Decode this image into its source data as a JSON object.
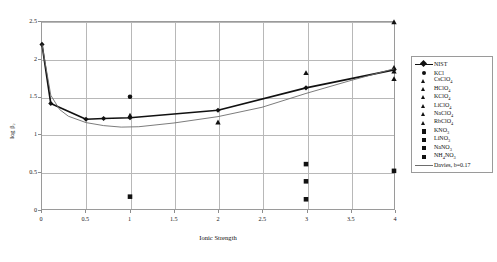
{
  "chart_data": {
    "type": "scatter",
    "title": "",
    "xlabel": "Ionic Strength",
    "ylabel": "log β₂",
    "xlim": [
      0,
      4
    ],
    "ylim": [
      0,
      2.5
    ],
    "xticks": [
      "0",
      "0.5",
      "1",
      "1.5",
      "2",
      "2.5",
      "3",
      "3.5",
      "4"
    ],
    "xtick_values": [
      0,
      0.5,
      1,
      1.5,
      2,
      2.5,
      3,
      3.5,
      4
    ],
    "yticks": [
      "0",
      "0.5",
      "1",
      "1.5",
      "2",
      "2.5"
    ],
    "ytick_values": [
      0,
      0.5,
      1,
      1.5,
      2,
      2.5
    ],
    "grid": true,
    "legend_position": "right",
    "series": [
      {
        "name": "NIST",
        "marker": "line-diamond",
        "color": "#111111",
        "points": [
          {
            "x": 0,
            "y": 2.2
          },
          {
            "x": 0.1,
            "y": 1.41
          },
          {
            "x": 0.5,
            "y": 1.2
          },
          {
            "x": 0.7,
            "y": 1.21
          },
          {
            "x": 1.0,
            "y": 1.22
          },
          {
            "x": 2.0,
            "y": 1.32
          },
          {
            "x": 3.0,
            "y": 1.62
          },
          {
            "x": 4.0,
            "y": 1.86
          }
        ]
      },
      {
        "name": "KCl",
        "marker": "circle",
        "color": "#111111",
        "points": [
          {
            "x": 1.0,
            "y": 1.5
          }
        ]
      },
      {
        "name": "CsClO₄",
        "marker": "triangle",
        "color": "#111111",
        "points": [
          {
            "x": 4.0,
            "y": 2.5
          }
        ]
      },
      {
        "name": "HClO₄",
        "marker": "triangle",
        "color": "#111111",
        "points": [
          {
            "x": 1.0,
            "y": 1.25
          },
          {
            "x": 2.0,
            "y": 1.16
          }
        ]
      },
      {
        "name": "KClO₄",
        "marker": "triangle",
        "color": "#111111",
        "points": [
          {
            "x": 3.0,
            "y": 1.82
          }
        ]
      },
      {
        "name": "LiClO₄",
        "marker": "triangle",
        "color": "#111111",
        "points": [
          {
            "x": 4.0,
            "y": 1.89
          }
        ]
      },
      {
        "name": "NaClO₄",
        "marker": "triangle",
        "color": "#111111",
        "points": [
          {
            "x": 4.0,
            "y": 1.74
          }
        ]
      },
      {
        "name": "RbClO₄",
        "marker": "triangle",
        "color": "#111111",
        "points": [
          {
            "x": 4.0,
            "y": 1.84
          }
        ]
      },
      {
        "name": "KNO₃",
        "marker": "square",
        "color": "#111111",
        "points": [
          {
            "x": 1.0,
            "y": 0.165
          }
        ]
      },
      {
        "name": "LiNO₃",
        "marker": "square",
        "color": "#111111",
        "points": [
          {
            "x": 3.0,
            "y": 0.6
          }
        ]
      },
      {
        "name": "NaNO₃",
        "marker": "square",
        "color": "#111111",
        "points": [
          {
            "x": 3.0,
            "y": 0.37
          },
          {
            "x": 4.0,
            "y": 0.51
          }
        ]
      },
      {
        "name": "NH₄NO₃",
        "marker": "square",
        "color": "#111111",
        "points": [
          {
            "x": 3.0,
            "y": 0.13
          }
        ]
      },
      {
        "name": "Davies, b=0.17",
        "marker": "thinline",
        "color": "#6d6d6d",
        "points": [
          {
            "x": 0,
            "y": 2.2
          },
          {
            "x": 0.1,
            "y": 1.52
          },
          {
            "x": 0.2,
            "y": 1.33
          },
          {
            "x": 0.3,
            "y": 1.24
          },
          {
            "x": 0.5,
            "y": 1.155
          },
          {
            "x": 0.7,
            "y": 1.115
          },
          {
            "x": 0.9,
            "y": 1.095
          },
          {
            "x": 1.1,
            "y": 1.1
          },
          {
            "x": 1.5,
            "y": 1.15
          },
          {
            "x": 2.0,
            "y": 1.235
          },
          {
            "x": 2.5,
            "y": 1.36
          },
          {
            "x": 3.0,
            "y": 1.545
          },
          {
            "x": 3.5,
            "y": 1.715
          },
          {
            "x": 4.0,
            "y": 1.875
          }
        ]
      }
    ]
  },
  "legend": {
    "entries": [
      {
        "label": "NIST",
        "marker": "line-diamond"
      },
      {
        "label": "KCl",
        "marker": "circle"
      },
      {
        "label": "CsClO4",
        "marker": "triangle"
      },
      {
        "label": "HClO4",
        "marker": "triangle"
      },
      {
        "label": "KClO4",
        "marker": "triangle"
      },
      {
        "label": "LiClO4",
        "marker": "triangle"
      },
      {
        "label": "NaClO4",
        "marker": "triangle"
      },
      {
        "label": "RbClO4",
        "marker": "triangle"
      },
      {
        "label": "KNO3",
        "marker": "square"
      },
      {
        "label": "LiNO3",
        "marker": "square"
      },
      {
        "label": "NaNO3",
        "marker": "square"
      },
      {
        "label": "NH4NO3",
        "marker": "square"
      },
      {
        "label": "Davies, b=0.17",
        "marker": "thinline"
      }
    ]
  },
  "axes": {
    "x_title": "Ionic Strength",
    "y_title": "log β₂"
  }
}
